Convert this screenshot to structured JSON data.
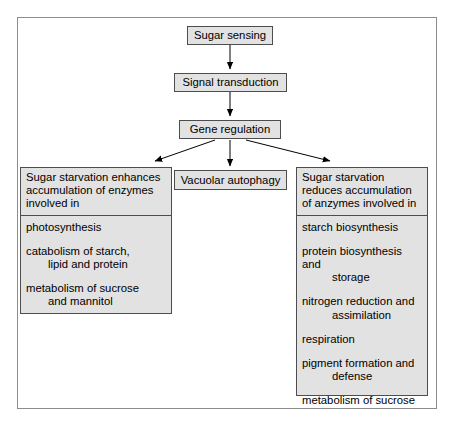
{
  "diagram": {
    "title_visible": false,
    "colors": {
      "box_fill": "#e2e2e2",
      "box_border": "#4d4d4d",
      "frame_border": "#8c8c8c",
      "arrow": "#000000",
      "text": "#000000",
      "background": "#ffffff"
    },
    "flow": {
      "sugar_sensing": "Sugar sensing",
      "signal_transduction": "Signal transduction",
      "gene_regulation": "Gene regulation",
      "vacuolar_autophagy": "Vacuolar autophagy"
    },
    "left_panel": {
      "header": "Sugar starvation enhances accumulation of enzymes involved in",
      "items": [
        {
          "main": "photosynthesis",
          "cont": ""
        },
        {
          "main": "catabolism of starch,",
          "cont": "lipid and protein"
        },
        {
          "main": "metabolism of sucrose",
          "cont": "and mannitol"
        }
      ]
    },
    "right_panel": {
      "header": "Sugar starvation reduces accumulation of anzymes involved in",
      "items": [
        {
          "main": "starch biosynthesis",
          "cont": ""
        },
        {
          "main": "protein biosynthesis and",
          "cont": "storage"
        },
        {
          "main": "nitrogen reduction and",
          "cont": "assimilation"
        },
        {
          "main": "respiration",
          "cont": ""
        },
        {
          "main": "pigment formation and",
          "cont": "defense"
        },
        {
          "main": "metabolism of sucrose",
          "cont": ""
        }
      ]
    },
    "edges": [
      {
        "from": "Sugar sensing",
        "to": "Signal transduction",
        "style": "arrow-down"
      },
      {
        "from": "Signal transduction",
        "to": "Gene regulation",
        "style": "arrow-down"
      },
      {
        "from": "Gene regulation",
        "to": "Sugar starvation enhances accumulation of enzymes involved in",
        "style": "arrow-diagonal-left"
      },
      {
        "from": "Gene regulation",
        "to": "Vacuolar autophagy",
        "style": "arrow-down"
      },
      {
        "from": "Gene regulation",
        "to": "Sugar starvation reduces accumulation of anzymes involved in",
        "style": "arrow-diagonal-right"
      }
    ]
  }
}
